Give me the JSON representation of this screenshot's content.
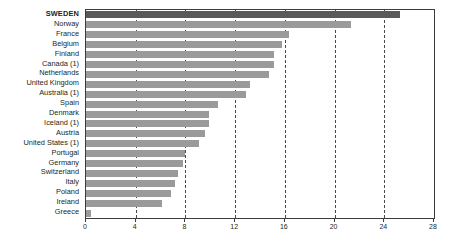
{
  "chart_data": {
    "type": "bar",
    "orientation": "horizontal",
    "title": "",
    "xlabel": "",
    "ylabel": "",
    "xlim": [
      0,
      28
    ],
    "xticks": [
      0,
      4,
      8,
      12,
      16,
      20,
      24,
      28
    ],
    "xtick_labels": [
      "0",
      "4",
      "8",
      "12",
      "16",
      "20",
      "24",
      "28"
    ],
    "gridlines": [
      4,
      8,
      12,
      16,
      20,
      24
    ],
    "grid": true,
    "legend": "none",
    "highlight_category": "SWEDEN",
    "colors": {
      "bar": "#9a9a9a",
      "highlight_bar": "#595959",
      "frame": "#3c3c3c",
      "gridline": "#4a4a4a",
      "text": "#231f20",
      "background": "#ffffff"
    },
    "categories": [
      "SWEDEN",
      "Norway",
      "France",
      "Belgium",
      "Finland",
      "Canada (1)",
      "Netherlands",
      "United Kingdom",
      "Australia (1)",
      "Spain",
      "Denmark",
      "Iceland (1)",
      "Austria",
      "United States (1)",
      "Portugal",
      "Germany",
      "Switzerland",
      "Italy",
      "Poland",
      "Ireland",
      "Greece"
    ],
    "values": [
      25.3,
      21.3,
      16.3,
      15.8,
      15.1,
      15.1,
      14.7,
      13.2,
      12.9,
      10.6,
      9.9,
      9.9,
      9.6,
      9.1,
      8.0,
      7.8,
      7.4,
      7.2,
      6.8,
      6.1,
      0.4
    ]
  }
}
